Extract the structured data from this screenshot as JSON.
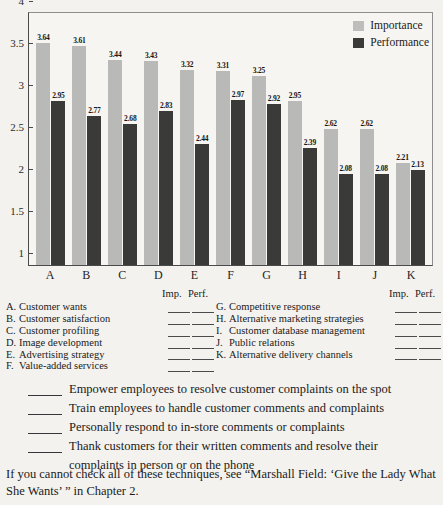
{
  "chart_data": {
    "type": "bar",
    "title": "",
    "xlabel": "",
    "ylabel": "",
    "ylim": [
      1,
      4
    ],
    "yticks": [
      "1",
      "1.5",
      "2",
      "2.5",
      "3",
      "3.5",
      "4"
    ],
    "grid": false,
    "legend_position": "top-right",
    "categories": [
      "A",
      "B",
      "C",
      "D",
      "E",
      "F",
      "G",
      "H",
      "I",
      "J",
      "K"
    ],
    "series": [
      {
        "name": "Importance",
        "color": "#b9b9b7",
        "values": [
          3.64,
          3.61,
          3.44,
          3.43,
          3.32,
          3.31,
          3.25,
          2.95,
          2.62,
          2.62,
          2.21
        ]
      },
      {
        "name": "Performance",
        "color": "#3a3a38",
        "values": [
          2.95,
          2.77,
          2.68,
          2.83,
          2.44,
          2.97,
          2.92,
          2.39,
          2.08,
          2.08,
          2.13
        ]
      }
    ]
  },
  "legend": {
    "importance": "Importance",
    "performance": "Performance"
  },
  "key": {
    "header_imp": "Imp.",
    "header_perf": "Perf.",
    "left_items": [
      {
        "letter": "A.",
        "text": "Customer wants"
      },
      {
        "letter": "B.",
        "text": "Customer satisfaction"
      },
      {
        "letter": "C.",
        "text": "Customer profiling"
      },
      {
        "letter": "D.",
        "text": "Image development"
      },
      {
        "letter": "E.",
        "text": "Advertising strategy"
      },
      {
        "letter": "F.",
        "text": "Value-added services"
      }
    ],
    "right_items": [
      {
        "letter": "G.",
        "text": "Competitive response"
      },
      {
        "letter": "H.",
        "text": "Alternative marketing strategies"
      },
      {
        "letter": "I.",
        "text": "Customer database management"
      },
      {
        "letter": "J.",
        "text": "Public relations"
      },
      {
        "letter": "K.",
        "text": "Alternative delivery channels"
      }
    ]
  },
  "checklist": {
    "items": [
      {
        "text": "Empower employees to resolve customer complaints on the spot",
        "cont": ""
      },
      {
        "text": "Train employees to handle customer comments and complaints",
        "cont": ""
      },
      {
        "text": "Personally respond to in-store comments or complaints",
        "cont": ""
      },
      {
        "text": "Thank customers for their written comments and resolve their",
        "cont": "complaints in person or on the phone"
      }
    ]
  },
  "closing": {
    "text": "If you cannot check all of these techniques, see “Marshall Field: ‘Give the Lady What She Wants’ ” in Chapter 2."
  }
}
